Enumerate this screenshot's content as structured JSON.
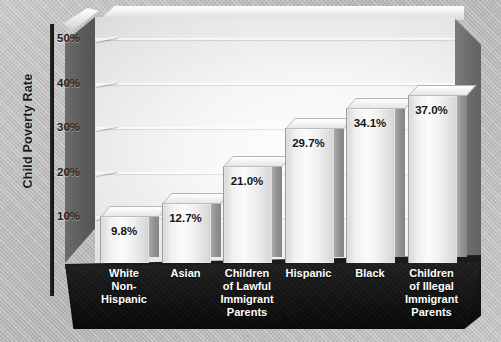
{
  "chart_data": {
    "type": "bar",
    "title": "",
    "xlabel": "",
    "ylabel": "Child Poverty Rate",
    "ylim": [
      0,
      55
    ],
    "grid": true,
    "legend": "none",
    "yticks": [
      "10%",
      "20%",
      "30%",
      "40%",
      "50%"
    ],
    "ytick_values": [
      10,
      20,
      30,
      40,
      50
    ],
    "categories": [
      "White Non-Hispanic",
      "Asian",
      "Children of Lawful Immigrant Parents",
      "Hispanic",
      "Black",
      "Children of Illegal Immigrant Parents"
    ],
    "category_lines": [
      [
        "White",
        "Non-",
        "Hispanic"
      ],
      [
        "Asian"
      ],
      [
        "Children",
        "of Lawful",
        "Immigrant",
        "Parents"
      ],
      [
        "Hispanic"
      ],
      [
        "Black"
      ],
      [
        "Children",
        "of Illegal",
        "Immigrant",
        "Parents"
      ]
    ],
    "values": [
      9.8,
      12.7,
      21.0,
      29.7,
      34.1,
      37.0
    ],
    "value_labels": [
      "9.8%",
      "12.7%",
      "21.0%",
      "29.7%",
      "34.1%",
      "37.0%"
    ]
  },
  "colors": {
    "background": "#bdbdbd",
    "base": "#101010",
    "bar_face": "#f2f2f2",
    "bar_side": "#8f8f8f",
    "axis": "#1d1d1d",
    "gridline": "#ffffff",
    "value_text": "#141414",
    "category_text": "#ffffff"
  }
}
